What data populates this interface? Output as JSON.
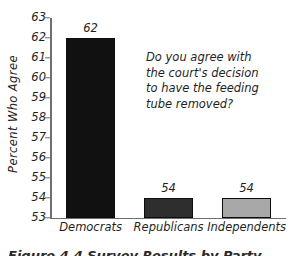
{
  "chart_data": {
    "type": "bar",
    "title": "",
    "subtitle": "",
    "xlabel": "",
    "ylabel": "Percent Who Agree",
    "categories": [
      "Democrats",
      "Republicans",
      "Independents"
    ],
    "values": [
      62,
      54,
      54
    ],
    "value_labels": [
      "62",
      "54",
      "54"
    ],
    "bar_colors": [
      "#111111",
      "#2e2e2e",
      "#a8a8a8"
    ],
    "bar_edge_color": "#0d0d0d",
    "ylim": [
      53,
      63
    ],
    "ytick_labels": [
      "53",
      "54",
      "55",
      "56",
      "57",
      "58",
      "59",
      "60",
      "61",
      "62",
      "63"
    ],
    "ytick_values": [
      53,
      54,
      55,
      56,
      57,
      58,
      59,
      60,
      61,
      62,
      63
    ],
    "grid": false,
    "legend": "none",
    "annotations": [
      "Do you agree with",
      "the court's decision",
      "to have the feeding",
      "tube removed?"
    ],
    "axis_color": "#6f6f6f",
    "background_color": "#ffffff",
    "text_color": "#1f1f1f",
    "style": "hand-drawn"
  },
  "caption": {
    "text": "Figure 4.4  Survey Results by Party"
  }
}
